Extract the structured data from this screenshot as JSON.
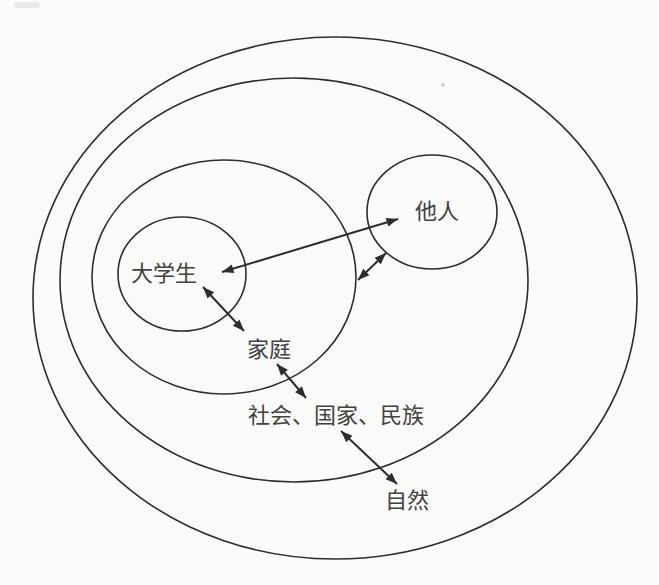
{
  "figure": {
    "background_color": "#fbfbfa",
    "line_color": "#2d2d2d",
    "text_color": "#424242",
    "labels": {
      "student": "大学生",
      "others": "他人",
      "family": "家庭",
      "society": "社会、国家、民族",
      "nature": "自然"
    },
    "relations": [
      {
        "from": "大学生",
        "to": "他人",
        "bidirectional": true
      },
      {
        "from": "大学生",
        "to": "家庭",
        "bidirectional": true
      },
      {
        "from": "家庭",
        "to": "他人",
        "bidirectional": true
      },
      {
        "from": "家庭",
        "to": "社会、国家、民族",
        "bidirectional": true
      },
      {
        "from": "社会、国家、民族",
        "to": "自然",
        "bidirectional": true
      }
    ]
  }
}
